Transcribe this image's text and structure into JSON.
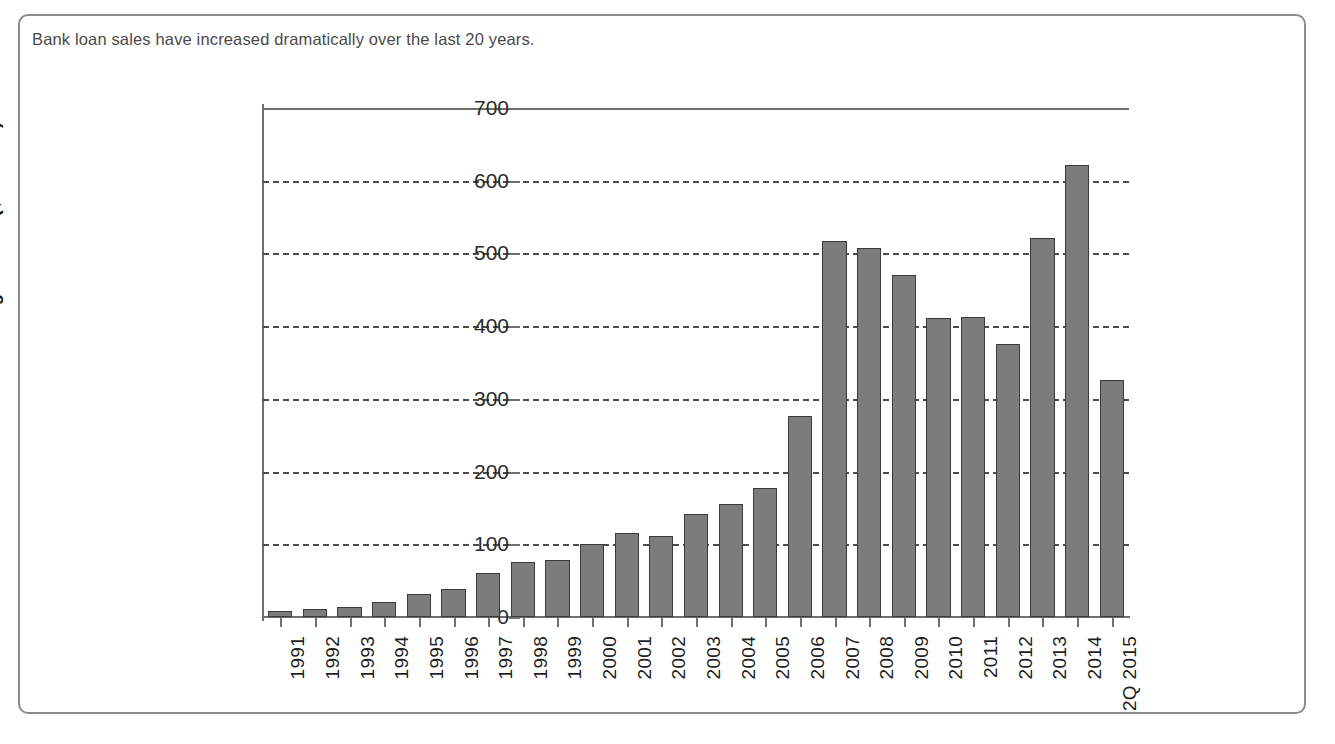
{
  "figure": {
    "caption": "Bank loan sales have increased dramatically over the last 20 years.",
    "border_color": "#8c8c8c",
    "background": "#ffffff"
  },
  "chart_data": {
    "type": "bar",
    "title": "",
    "subtitle": "",
    "xlabel": "",
    "ylabel": "Trading Volume ($ billions)",
    "ylim": [
      0,
      700
    ],
    "yticks": [
      0,
      100,
      200,
      300,
      400,
      500,
      600,
      700
    ],
    "ytick_labels": [
      "0",
      "100",
      "200",
      "300",
      "400",
      "500",
      "600",
      "700"
    ],
    "grid": "horizontal-dashed",
    "legend": "none",
    "bar_color": "#7c7c7c",
    "bar_edge_color": "#3a3a3a",
    "categories": [
      "1991",
      "1992",
      "1993",
      "1994",
      "1995",
      "1996",
      "1997",
      "1998",
      "1999",
      "2000",
      "2001",
      "2002",
      "2003",
      "2004",
      "2005",
      "2006",
      "2007",
      "2008",
      "2009",
      "2010",
      "2011",
      "2012",
      "2013",
      "2014",
      "2Q 2015"
    ],
    "values": [
      8,
      11,
      14,
      21,
      32,
      39,
      60,
      76,
      79,
      100,
      115,
      111,
      142,
      155,
      178,
      277,
      517,
      508,
      470,
      411,
      413,
      376,
      521,
      622,
      326
    ],
    "series": [
      {
        "name": "Trading Volume",
        "values": [
          8,
          11,
          14,
          21,
          32,
          39,
          60,
          76,
          79,
          100,
          115,
          111,
          142,
          155,
          178,
          277,
          517,
          508,
          470,
          411,
          413,
          376,
          521,
          622,
          326
        ]
      }
    ]
  }
}
